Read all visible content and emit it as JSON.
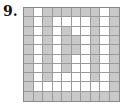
{
  "problem": {
    "number_label": "9.",
    "grid": {
      "rows": 10,
      "cols": 10,
      "fill_color": "#c9c9c9",
      "empty_color": "#ffffff",
      "line_color": "#9a9a9a",
      "cells": [
        [
          1,
          0,
          1,
          1,
          1,
          1,
          1,
          1,
          0,
          1
        ],
        [
          1,
          0,
          1,
          0,
          0,
          0,
          0,
          1,
          0,
          1
        ],
        [
          1,
          0,
          1,
          0,
          1,
          0,
          0,
          1,
          0,
          1
        ],
        [
          1,
          0,
          1,
          0,
          1,
          1,
          0,
          1,
          0,
          1
        ],
        [
          1,
          0,
          1,
          0,
          1,
          1,
          0,
          1,
          0,
          1
        ],
        [
          1,
          0,
          1,
          0,
          1,
          0,
          0,
          1,
          0,
          1
        ],
        [
          1,
          0,
          1,
          0,
          1,
          0,
          0,
          1,
          0,
          1
        ],
        [
          1,
          0,
          1,
          0,
          0,
          0,
          0,
          1,
          0,
          1
        ],
        [
          1,
          0,
          0,
          0,
          0,
          0,
          0,
          0,
          0,
          1
        ],
        [
          1,
          1,
          1,
          1,
          1,
          1,
          1,
          1,
          1,
          1
        ]
      ]
    }
  }
}
